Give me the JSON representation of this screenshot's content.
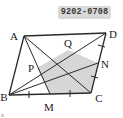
{
  "image": {
    "width": 123,
    "height": 118,
    "background_color": "#ffffff"
  },
  "badge": {
    "text": "9202-0708",
    "background_color": "#d9d9d9",
    "text_color": "#3a3a3a"
  },
  "figure": {
    "type": "geometry-diagram",
    "stroke_color": "#2a2a2a",
    "shaded_fill": "#d6d6d6",
    "points": {
      "A": {
        "x": 24,
        "y": 36,
        "label": "A",
        "label_x": 14,
        "label_y": 36
      },
      "D": {
        "x": 106,
        "y": 33,
        "label": "D",
        "label_x": 110,
        "label_y": 36
      },
      "B": {
        "x": 9,
        "y": 95,
        "label": "B",
        "label_x": 1,
        "label_y": 98
      },
      "C": {
        "x": 91,
        "y": 93,
        "label": "C",
        "label_x": 95,
        "label_y": 100
      },
      "M": {
        "x": 50,
        "y": 94,
        "label": "M",
        "label_x": 45,
        "label_y": 110
      },
      "N": {
        "x": 98,
        "y": 63,
        "label": "N",
        "label_x": 101,
        "label_y": 66
      },
      "P": {
        "x": 37,
        "y": 68,
        "label": "P",
        "label_x": 30,
        "label_y": 70
      },
      "Q": {
        "x": 68,
        "y": 50,
        "label": "Q",
        "label_x": 63,
        "label_y": 47
      }
    },
    "segments": [
      {
        "name": "AD",
        "from": "A",
        "to": "D"
      },
      {
        "name": "BC",
        "from": "B",
        "to": "C"
      },
      {
        "name": "AB",
        "from": "A",
        "to": "B"
      },
      {
        "name": "DC",
        "from": "D",
        "to": "C"
      },
      {
        "name": "AM",
        "from": "A",
        "to": "M"
      },
      {
        "name": "AC",
        "from": "A",
        "to": "C"
      },
      {
        "name": "BD",
        "from": "B",
        "to": "D"
      },
      {
        "name": "BN",
        "from": "B",
        "to": "N"
      }
    ],
    "shaded_region": {
      "name": "pentagon-PQNCM",
      "vertices": [
        "P",
        "Q",
        "N",
        "C",
        "M"
      ],
      "fill": "#d6d6d6"
    },
    "tick_marks": [
      {
        "name": "tick-BM",
        "segment": "BM",
        "count": 1
      },
      {
        "name": "tick-MC",
        "segment": "MC",
        "count": 1
      },
      {
        "name": "tick-DN",
        "segment": "DN",
        "count": 1
      },
      {
        "name": "tick-NC",
        "segment": "NC",
        "count": 1
      }
    ]
  }
}
